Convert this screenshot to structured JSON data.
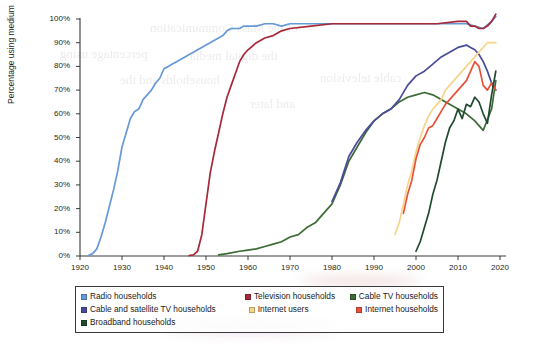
{
  "chart_data": {
    "type": "line",
    "title": "",
    "subtitle": "",
    "xlabel": "",
    "ylabel": "Percentage using medium",
    "xlim": [
      1920,
      2020
    ],
    "ylim": [
      0,
      100
    ],
    "xticks": [
      1920,
      1930,
      1940,
      1950,
      1960,
      1970,
      1980,
      1990,
      2000,
      2010,
      2020
    ],
    "xtick_labels": [
      "1920",
      "1930",
      "1940",
      "1950",
      "1960",
      "1970",
      "1980",
      "1990",
      "2000",
      "2010",
      "2020"
    ],
    "yticks": [
      0,
      10,
      20,
      30,
      40,
      50,
      60,
      70,
      80,
      90,
      100
    ],
    "ytick_labels": [
      "0%",
      "10%",
      "20%",
      "30%",
      "40%",
      "50%",
      "60%",
      "70%",
      "80%",
      "90%",
      "100%"
    ],
    "grid": false,
    "legend_position": "below-plot",
    "series": [
      {
        "name": "Radio households",
        "color": "#6699d8",
        "x": [
          1922,
          1923,
          1924,
          1925,
          1926,
          1927,
          1928,
          1929,
          1930,
          1931,
          1932,
          1933,
          1934,
          1935,
          1936,
          1937,
          1938,
          1939,
          1940,
          1941,
          1942,
          1943,
          1944,
          1945,
          1946,
          1947,
          1948,
          1949,
          1950,
          1951,
          1952,
          1953,
          1954,
          1955,
          1956,
          1957,
          1958,
          1959,
          1960,
          1962,
          1964,
          1966,
          1968,
          1970,
          1975,
          1980,
          1985,
          1990,
          1995,
          2000,
          2005,
          2010,
          2012,
          2014,
          2016,
          2018,
          2019
        ],
        "y": [
          0.2,
          1,
          3,
          8,
          14,
          21,
          28,
          36,
          46,
          52,
          58,
          61,
          62,
          66,
          68,
          70,
          73,
          75,
          79,
          80,
          81,
          82,
          83,
          84,
          85,
          86,
          87,
          88,
          89,
          90,
          91,
          92,
          93,
          95,
          96,
          96,
          96,
          97,
          97,
          97,
          98,
          98,
          97,
          98,
          98,
          98,
          98,
          98,
          98,
          98,
          98,
          98,
          98,
          97,
          96,
          99,
          101
        ]
      },
      {
        "name": "Television households",
        "color": "#a6293a",
        "x": [
          1946,
          1947,
          1948,
          1949,
          1950,
          1951,
          1952,
          1953,
          1954,
          1955,
          1956,
          1957,
          1958,
          1959,
          1960,
          1962,
          1964,
          1966,
          1968,
          1970,
          1975,
          1980,
          1985,
          1990,
          1995,
          2000,
          2005,
          2010,
          2012,
          2013,
          2014,
          2015,
          2016,
          2017,
          2018,
          2019
        ],
        "y": [
          0.2,
          0.5,
          2,
          9,
          22,
          35,
          44,
          52,
          60,
          67,
          72,
          77,
          82,
          85,
          87,
          90,
          92,
          93,
          95,
          96,
          97,
          98,
          98,
          98,
          98,
          98,
          98,
          99,
          99,
          97,
          97,
          96,
          96,
          97,
          99,
          102
        ]
      },
      {
        "name": "Cable TV households",
        "color": "#3d6b35",
        "x": [
          1953,
          1955,
          1958,
          1960,
          1962,
          1964,
          1966,
          1968,
          1970,
          1972,
          1974,
          1976,
          1978,
          1980,
          1982,
          1984,
          1986,
          1988,
          1990,
          1992,
          1994,
          1996,
          1998,
          2000,
          2002,
          2004,
          2006,
          2008,
          2010,
          2012,
          2014,
          2016,
          2018,
          2019
        ],
        "y": [
          0.5,
          1,
          2,
          2.5,
          3,
          4,
          5,
          6,
          8,
          9,
          12,
          14,
          18,
          22,
          30,
          40,
          46,
          52,
          57,
          60,
          62,
          65,
          67,
          68,
          69,
          68,
          66,
          64,
          62,
          60,
          57,
          53,
          62,
          74
        ]
      },
      {
        "name": "Cable and satellite TV households",
        "color": "#4a4b9b",
        "x": [
          1980,
          1982,
          1984,
          1986,
          1988,
          1990,
          1992,
          1994,
          1996,
          1998,
          2000,
          2002,
          2004,
          2006,
          2008,
          2010,
          2012,
          2013,
          2014,
          2015,
          2016,
          2017,
          2018,
          2019
        ],
        "y": [
          23,
          31,
          42,
          48,
          53,
          57,
          60,
          62,
          66,
          72,
          76,
          78,
          81,
          84,
          86,
          88,
          89,
          88,
          87,
          85,
          82,
          78,
          73,
          70
        ]
      },
      {
        "name": "Internet users",
        "color": "#f7d48a",
        "x": [
          1995,
          1996,
          1997,
          1998,
          1999,
          2000,
          2001,
          2002,
          2003,
          2004,
          2005,
          2006,
          2007,
          2008,
          2009,
          2010,
          2011,
          2012,
          2013,
          2014,
          2015,
          2016,
          2017,
          2018,
          2019
        ],
        "y": [
          9,
          14,
          22,
          30,
          36,
          44,
          50,
          55,
          59,
          62,
          64,
          66,
          70,
          72,
          74,
          76,
          78,
          80,
          82,
          84,
          86,
          88,
          90,
          90,
          90
        ]
      },
      {
        "name": "Internet households",
        "color": "#e8503a",
        "x": [
          1997,
          1998,
          1999,
          2000,
          2001,
          2002,
          2003,
          2004,
          2005,
          2006,
          2007,
          2008,
          2009,
          2010,
          2011,
          2012,
          2013,
          2014,
          2015,
          2016,
          2017,
          2018,
          2019
        ],
        "y": [
          18,
          26,
          32,
          41,
          47,
          50,
          54,
          55,
          58,
          61,
          64,
          66,
          68,
          70,
          72,
          74,
          78,
          82,
          80,
          72,
          70,
          73,
          70
        ]
      },
      {
        "name": "Broadband households",
        "color": "#1f4a2e",
        "x": [
          2000,
          2001,
          2002,
          2003,
          2004,
          2005,
          2006,
          2007,
          2008,
          2009,
          2010,
          2011,
          2012,
          2013,
          2014,
          2015,
          2016,
          2017,
          2018,
          2019
        ],
        "y": [
          2,
          6,
          12,
          18,
          26,
          32,
          40,
          48,
          54,
          57,
          62,
          58,
          64,
          63,
          67,
          65,
          60,
          56,
          68,
          78
        ]
      }
    ]
  },
  "legend": {
    "rows": [
      [
        {
          "label": "Radio households",
          "color": "#6699d8",
          "column": "a"
        },
        {
          "label": "Television households",
          "color": "#a6293a",
          "column": "b"
        },
        {
          "label": "Cable TV households",
          "color": "#3d6b35",
          "column": "c"
        }
      ],
      [
        {
          "label": "Cable and satellite TV households",
          "color": "#4a4b9b",
          "column": "a"
        },
        {
          "label": "Internet users",
          "color": "#f7d48a",
          "column": "b"
        },
        {
          "label": "Internet households",
          "color": "#e8503a",
          "column": "c"
        }
      ],
      [
        {
          "label": "Broadband households",
          "color": "#1f4a2e",
          "column": "a"
        }
      ]
    ]
  },
  "ghost_text": [
    {
      "text": "of the Mass Communication",
      "x": 150,
      "y": 20,
      "size": 13
    },
    {
      "text": "percentage using",
      "x": 60,
      "y": 46,
      "size": 13
    },
    {
      "text": "the digital media",
      "x": 190,
      "y": 48,
      "size": 13
    },
    {
      "text": "households and the",
      "x": 120,
      "y": 72,
      "size": 13
    },
    {
      "text": "cable television",
      "x": 320,
      "y": 70,
      "size": 13
    },
    {
      "text": "and later",
      "x": 250,
      "y": 96,
      "size": 13
    }
  ]
}
